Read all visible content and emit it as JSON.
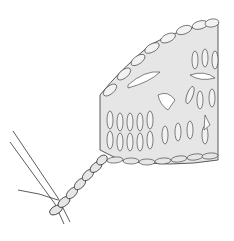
{
  "illustration": {
    "subject": "crochet-swatch-with-chain-and-hook",
    "colors": {
      "background": "#ffffff",
      "stroke": "#333333",
      "fill": "#e6e6e6"
    }
  }
}
